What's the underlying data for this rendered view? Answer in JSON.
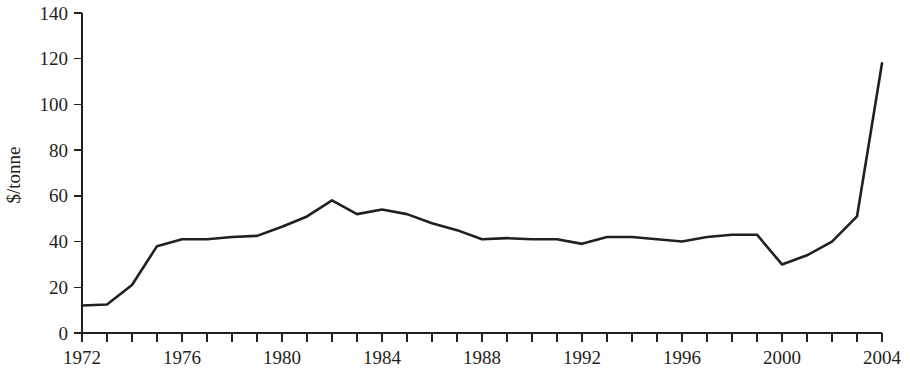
{
  "chart_data": {
    "type": "line",
    "title": "",
    "subtitle": "",
    "xlabel": "",
    "ylabel": "$/tonne",
    "xlim": [
      1972,
      2004
    ],
    "ylim": [
      0,
      140
    ],
    "grid": false,
    "legend": null,
    "y_ticks": [
      0,
      20,
      40,
      60,
      80,
      100,
      120,
      140
    ],
    "y_tick_labels": [
      "0",
      "20",
      "40",
      "60",
      "80",
      "100",
      "120",
      "140"
    ],
    "x_ticks": [
      1972,
      1973,
      1974,
      1975,
      1976,
      1977,
      1978,
      1979,
      1980,
      1981,
      1982,
      1983,
      1984,
      1985,
      1986,
      1987,
      1988,
      1989,
      1990,
      1991,
      1992,
      1993,
      1994,
      1995,
      1996,
      1997,
      1998,
      1999,
      2000,
      2001,
      2002,
      2003,
      2004
    ],
    "x_tick_labels": [
      "1972",
      "",
      "",
      "",
      "1976",
      "",
      "",
      "",
      "1980",
      "",
      "",
      "",
      "1984",
      "",
      "",
      "",
      "1988",
      "",
      "",
      "",
      "1992",
      "",
      "",
      "",
      "1996",
      "",
      "",
      "",
      "2000",
      "",
      "",
      "",
      "2004"
    ],
    "x_labeled_ticks": [
      1972,
      1976,
      1980,
      1984,
      1988,
      1992,
      1996,
      2000,
      2004
    ],
    "series": [
      {
        "name": "price",
        "color": "#231f20",
        "x": [
          1972,
          1973,
          1974,
          1975,
          1976,
          1977,
          1978,
          1979,
          1980,
          1981,
          1982,
          1983,
          1984,
          1985,
          1986,
          1987,
          1988,
          1989,
          1990,
          1991,
          1992,
          1993,
          1994,
          1995,
          1996,
          1997,
          1998,
          1999,
          2000,
          2001,
          2002,
          2003,
          2004
        ],
        "values": [
          12,
          12.5,
          21,
          38,
          41,
          41,
          42,
          42.5,
          46.5,
          51,
          58,
          52,
          54,
          52,
          48,
          45,
          41,
          41.5,
          41,
          41,
          39,
          42,
          42,
          41,
          40,
          42,
          43,
          43,
          30,
          34,
          40,
          51,
          118
        ]
      }
    ]
  }
}
